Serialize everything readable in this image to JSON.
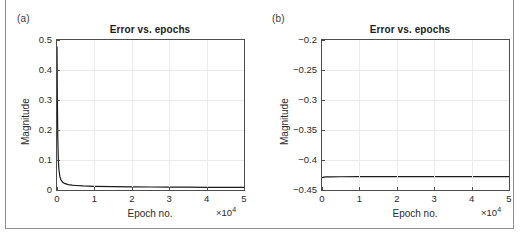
{
  "figure": {
    "background": "#ffffff",
    "axis_color": "#4d4d4d",
    "grid_color": "#ececec",
    "curve_color": "#1a1a1a"
  },
  "panels": [
    {
      "tag": "(a)",
      "title": "Error vs. epochs",
      "xlabel": "Epoch no.",
      "ylabel": "Magnitude",
      "x_exponent_prefix": "×10",
      "x_exponent_power": "4",
      "xticks": [
        "0",
        "1",
        "2",
        "3",
        "4",
        "5"
      ],
      "yticks": [
        "0",
        "0.1",
        "0.2",
        "0.3",
        "0.4",
        "0.5"
      ]
    },
    {
      "tag": "(b)",
      "title": "Error vs. epochs",
      "xlabel": "Epoch no.",
      "ylabel": "Magnitude",
      "x_exponent_prefix": "×10",
      "x_exponent_power": "4",
      "xticks": [
        "0",
        "1",
        "2",
        "3",
        "4",
        "5"
      ],
      "yticks": [
        "−0.45",
        "−0.4",
        "−0.35",
        "−0.3",
        "−0.25",
        "−0.2"
      ]
    }
  ],
  "chart_data": [
    {
      "type": "line",
      "panel": "(a)",
      "title": "Error vs. epochs",
      "xlabel": "Epoch no.",
      "ylabel": "Magnitude",
      "x_scale_factor": 10000,
      "x_exponent_label": "×10^4",
      "xlim": [
        0,
        50000
      ],
      "ylim": [
        0,
        0.5
      ],
      "xticks": [
        0,
        10000,
        20000,
        30000,
        40000,
        50000
      ],
      "yticks": [
        0,
        0.1,
        0.2,
        0.3,
        0.4,
        0.5
      ],
      "grid": true,
      "legend": null,
      "series": [
        {
          "name": "error",
          "x": [
            0,
            100,
            200,
            350,
            500,
            750,
            1000,
            1500,
            2000,
            3000,
            4000,
            5000,
            7000,
            10000,
            15000,
            20000,
            25000,
            30000,
            35000,
            40000,
            45000,
            50000
          ],
          "y": [
            0.478,
            0.3,
            0.18,
            0.105,
            0.07,
            0.046,
            0.035,
            0.026,
            0.022,
            0.018,
            0.016,
            0.015,
            0.0135,
            0.0122,
            0.0112,
            0.0105,
            0.01,
            0.0096,
            0.0093,
            0.009,
            0.0088,
            0.0086
          ]
        }
      ]
    },
    {
      "type": "line",
      "panel": "(b)",
      "title": "Error vs. epochs",
      "xlabel": "Epoch no.",
      "ylabel": "Magnitude",
      "x_scale_factor": 10000,
      "x_exponent_label": "×10^4",
      "xlim": [
        0,
        50000
      ],
      "ylim": [
        -0.45,
        -0.2
      ],
      "xticks": [
        0,
        10000,
        20000,
        30000,
        40000,
        50000
      ],
      "yticks": [
        -0.45,
        -0.4,
        -0.35,
        -0.3,
        -0.25,
        -0.2
      ],
      "grid": true,
      "legend": null,
      "series": [
        {
          "name": "error",
          "x": [
            0,
            500,
            1000,
            2000,
            5000,
            10000,
            20000,
            30000,
            40000,
            50000
          ],
          "y": [
            -0.4295,
            -0.4285,
            -0.4282,
            -0.428,
            -0.4279,
            -0.4278,
            -0.4277,
            -0.4277,
            -0.4276,
            -0.4276
          ]
        }
      ]
    }
  ]
}
